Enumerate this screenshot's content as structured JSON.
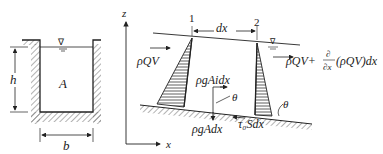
{
  "channel_section": {
    "depth_label": "h",
    "area_label": "A",
    "width_label": "b",
    "water_surface_symbol": "∇"
  },
  "control_volume": {
    "axis_z": "z",
    "axis_x": "x",
    "section_1": "1",
    "section_2": "2",
    "length_label": "dx",
    "inflow_momentum": "ρQV",
    "outflow_momentum_prefix": "ρQV+",
    "outflow_partial_num": "∂",
    "outflow_partial_den": "∂x",
    "outflow_momentum_suffix": "(ρQV)dx",
    "gravity_component": "ρgAidx",
    "weight": "ρgAdx",
    "shear_force": "τ₀Sdx",
    "angle_theta": "θ",
    "angle_theta_bed": "θ"
  },
  "colors": {
    "line": "#222222",
    "hatch": "#555555"
  }
}
